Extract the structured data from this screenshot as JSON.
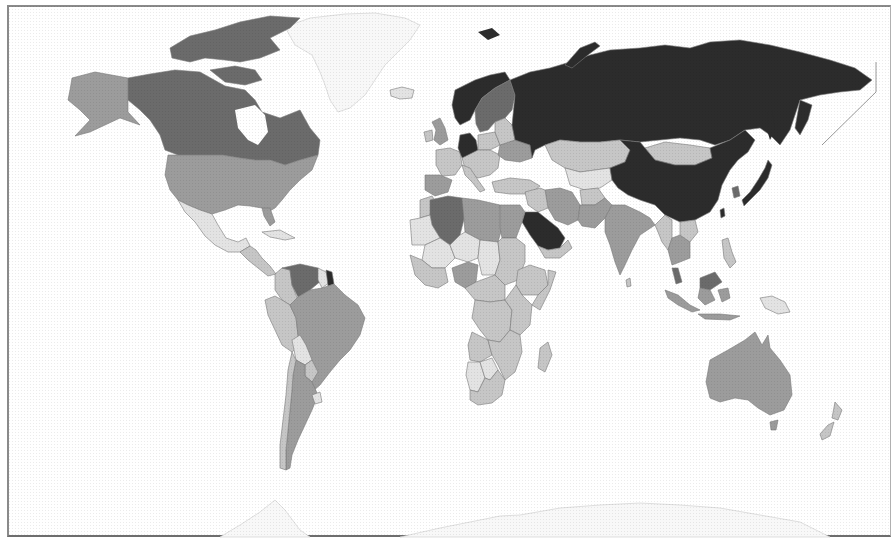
{
  "map": {
    "type": "choropleth",
    "projection": "world",
    "palette": {
      "level_5_darkest": "#2c2c2c",
      "level_4_dark": "#6b6b6b",
      "level_3_medium": "#9c9c9c",
      "level_2_light": "#c6c6c6",
      "level_1_lightest": "#e3e3e3",
      "no_data": "#f6f6f6",
      "border": "#7a7a7a",
      "frame": "#8a8a8a"
    },
    "regions": [
      {
        "name": "Russia",
        "level": 5
      },
      {
        "name": "China",
        "level": 5
      },
      {
        "name": "Saudi Arabia",
        "level": 5
      },
      {
        "name": "Norway",
        "level": 5
      },
      {
        "name": "Germany",
        "level": 5
      },
      {
        "name": "Japan",
        "level": 5
      },
      {
        "name": "French Guiana",
        "level": 5
      },
      {
        "name": "Taiwan",
        "level": 5
      },
      {
        "name": "Canada",
        "level": 4
      },
      {
        "name": "Sweden",
        "level": 4
      },
      {
        "name": "Algeria",
        "level": 4
      },
      {
        "name": "Venezuela",
        "level": 4
      },
      {
        "name": "South Korea",
        "level": 4
      },
      {
        "name": "Malaysia",
        "level": 4
      },
      {
        "name": "Alaska (United States)",
        "level": 3
      },
      {
        "name": "United States",
        "level": 3
      },
      {
        "name": "Brazil",
        "level": 3
      },
      {
        "name": "Argentina",
        "level": 3
      },
      {
        "name": "Australia",
        "level": 3
      },
      {
        "name": "Iran",
        "level": 3
      },
      {
        "name": "India",
        "level": 3
      },
      {
        "name": "Nigeria",
        "level": 3
      },
      {
        "name": "Libya",
        "level": 3
      },
      {
        "name": "Egypt",
        "level": 3
      },
      {
        "name": "Spain",
        "level": 3
      },
      {
        "name": "United Kingdom",
        "level": 3
      },
      {
        "name": "Ukraine",
        "level": 3
      },
      {
        "name": "Indonesia",
        "level": 3
      },
      {
        "name": "Pakistan",
        "level": 3
      },
      {
        "name": "Thailand",
        "level": 3
      },
      {
        "name": "Mexico",
        "level": 2
      },
      {
        "name": "Kazakhstan",
        "level": 2
      },
      {
        "name": "Mongolia",
        "level": 2
      },
      {
        "name": "Colombia",
        "level": 2
      },
      {
        "name": "Peru",
        "level": 2
      },
      {
        "name": "Chile",
        "level": 2
      },
      {
        "name": "France",
        "level": 2
      },
      {
        "name": "Poland",
        "level": 2
      },
      {
        "name": "Turkey",
        "level": 2
      },
      {
        "name": "Afghanistan",
        "level": 2
      },
      {
        "name": "Sudan",
        "level": 2
      },
      {
        "name": "Ethiopia",
        "level": 2
      },
      {
        "name": "DR Congo",
        "level": 2
      },
      {
        "name": "Angola",
        "level": 2
      },
      {
        "name": "South Africa",
        "level": 2
      },
      {
        "name": "Madagascar",
        "level": 2
      },
      {
        "name": "Myanmar",
        "level": 2
      },
      {
        "name": "Philippines",
        "level": 2
      },
      {
        "name": "Papua New Guinea",
        "level": 2
      },
      {
        "name": "New Zealand",
        "level": 2
      },
      {
        "name": "Bolivia",
        "level": 1
      },
      {
        "name": "Mauritania",
        "level": 1
      },
      {
        "name": "Mali",
        "level": 1
      },
      {
        "name": "Niger",
        "level": 1
      },
      {
        "name": "Chad",
        "level": 1
      },
      {
        "name": "Namibia",
        "level": 1
      },
      {
        "name": "Iceland",
        "level": 1
      },
      {
        "name": "Greenland",
        "level": 0
      },
      {
        "name": "Antarctica",
        "level": 0
      }
    ]
  }
}
